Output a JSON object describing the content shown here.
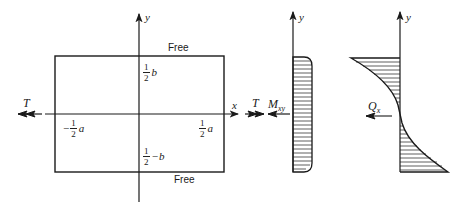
{
  "diagram": {
    "plate": {
      "top_edge_label": "Free",
      "bottom_edge_label": "Free",
      "x_axis_label": "x",
      "y_axis_label": "y",
      "left_load_label": "T",
      "right_load_label": "T",
      "left_coord": {
        "sign": "−",
        "num": "1",
        "den": "2",
        "var": "a"
      },
      "right_coord": {
        "sign": "",
        "num": "1",
        "den": "2",
        "var": "a"
      },
      "top_coord": {
        "num": "1",
        "den": "2",
        "var": "b"
      },
      "bottom_coord": {
        "num": "1",
        "den": "2",
        "var": "−b"
      }
    },
    "moment_diagram": {
      "label_main": "M",
      "label_sub": "xy",
      "y_axis_label": "y"
    },
    "shear_diagram": {
      "label_main": "Q",
      "label_sub": "x",
      "y_axis_label": "y"
    }
  }
}
